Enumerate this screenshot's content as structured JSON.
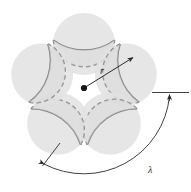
{
  "figure": {
    "name": "rosette-geometry-diagram",
    "background": "#ffffff",
    "petal_count": 5,
    "labels": {
      "radius": "r",
      "wavelength": "λ"
    },
    "colors": {
      "fill": "#e2e2e2",
      "fill_overlap": "#d8d8d8",
      "stroke_solid": "#808080",
      "stroke_dashed": "#8a8a8a",
      "annotation": "#2b2b2b",
      "center_dot": "#151515"
    },
    "geometry": {
      "center": [
        84,
        88
      ],
      "circumcircle_radius": 52,
      "petal_circle_radius": 31,
      "radius_arrow_from": [
        84,
        88
      ],
      "radius_arrow_to": [
        134,
        57
      ],
      "radius_label_pos": [
        101,
        72
      ],
      "wavelength_arc_radius": 86,
      "wavelength_label_pos": [
        152,
        170
      ],
      "tick_line_from": [
        152,
        93
      ],
      "tick_line_to": [
        188,
        93
      ],
      "tick_arrow_at": [
        170,
        99
      ]
    },
    "annotations": [
      {
        "name": "radius-arrow",
        "label": "r",
        "kind": "arrow"
      },
      {
        "name": "wavelength-arc",
        "label": "λ",
        "kind": "double-arrow-arc"
      },
      {
        "name": "arc-start-tick",
        "label": "",
        "kind": "tick"
      },
      {
        "name": "center-point",
        "label": "",
        "kind": "dot"
      }
    ]
  }
}
